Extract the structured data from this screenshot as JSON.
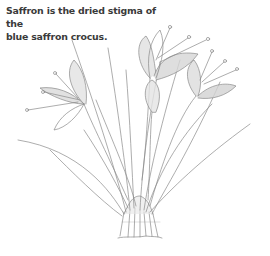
{
  "caption": {
    "line1": "Saffron is the dried stigma of the",
    "line2": "blue saffron crocus."
  },
  "illustration": {
    "subject": "saffron-crocus-plant-drawing",
    "stroke_color": "#8a8a8a",
    "shade_color": "#d6d6d6"
  }
}
